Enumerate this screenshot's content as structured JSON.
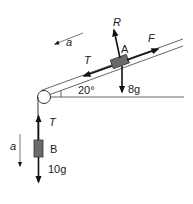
{
  "diagram": {
    "type": "connected-particles-pulley",
    "incline_angle_label": "20°",
    "block_a": {
      "label": "A",
      "forces": {
        "normal": "R",
        "applied": "F",
        "tension": "T",
        "weight": "8g"
      }
    },
    "block_b": {
      "label": "B",
      "forces": {
        "tension": "T",
        "weight": "10g"
      }
    },
    "acceleration_labels": {
      "incline": "a",
      "vertical": "a"
    },
    "colors": {
      "line": "#444444",
      "arrow": "#111111",
      "block_fill": "#6b6b6b",
      "block_stroke": "#333333"
    }
  }
}
